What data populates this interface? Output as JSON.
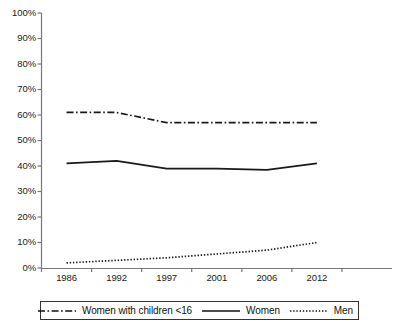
{
  "chart_data": {
    "type": "line",
    "title": "",
    "xlabel": "",
    "ylabel": "",
    "categories": [
      "1986",
      "1992",
      "1997",
      "2001",
      "2006",
      "2012"
    ],
    "ylim": [
      0,
      100
    ],
    "yticks": [
      "0%",
      "10%",
      "20%",
      "30%",
      "40%",
      "50%",
      "60%",
      "70%",
      "80%",
      "90%",
      "100%"
    ],
    "ytick_values": [
      0,
      10,
      20,
      30,
      40,
      50,
      60,
      70,
      80,
      90,
      100
    ],
    "grid": false,
    "legend_position": "bottom",
    "series": [
      {
        "name": "Women with children <16",
        "style": "dash-dot",
        "color": "#1a1a1a",
        "values": [
          61,
          61,
          57,
          57,
          57,
          57
        ]
      },
      {
        "name": "Women",
        "style": "solid",
        "color": "#1a1a1a",
        "values": [
          41,
          42,
          39,
          39,
          38.5,
          41
        ]
      },
      {
        "name": "Men",
        "style": "dotted",
        "color": "#1a1a1a",
        "values": [
          2,
          3,
          4,
          5.5,
          7,
          10
        ]
      }
    ]
  },
  "axis": {
    "line_color": "#777777"
  },
  "legend": {
    "entries": [
      {
        "label": "Women with children <16",
        "icon": "dash-dot-line-icon"
      },
      {
        "label": "Women",
        "icon": "solid-line-icon"
      },
      {
        "label": "Men",
        "icon": "dotted-line-icon"
      }
    ]
  }
}
